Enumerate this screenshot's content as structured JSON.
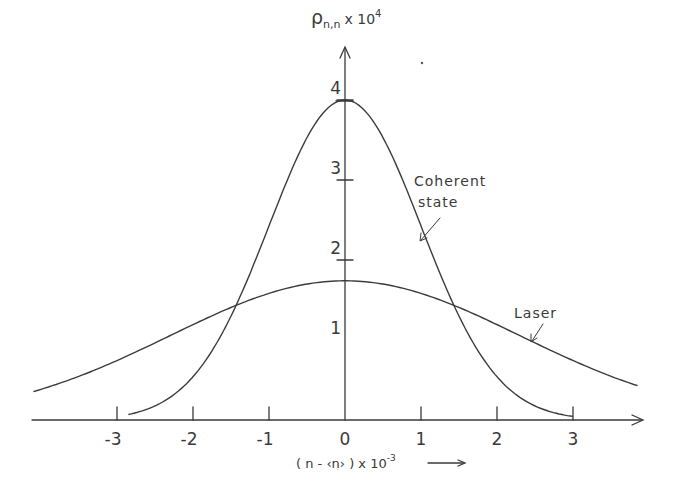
{
  "chart_data": {
    "type": "line",
    "title": "",
    "xlabel": "(n-<n>) x 10^-3",
    "ylabel": "ρ_{n,n} x 10^4",
    "xlim": [
      -4.1,
      3.9
    ],
    "ylim": [
      0,
      4.4
    ],
    "grid": false,
    "legend": "none (curves annotated directly)",
    "x_ticks": [
      -3,
      -2,
      -1,
      0,
      1,
      2,
      3
    ],
    "x_tick_labels": [
      "-3",
      "-2",
      "-1",
      "0",
      "1",
      "2",
      "3"
    ],
    "y_ticks": [
      1,
      2,
      3,
      4
    ],
    "y_tick_labels": [
      "1",
      "2",
      "3",
      "4"
    ],
    "series": [
      {
        "name": "Coherent state",
        "shape": "gaussian",
        "peak": 4.0,
        "center": 0,
        "sigma": 1.0,
        "x_range": [
          -2.85,
          3.0
        ],
        "x": [
          -2.85,
          -2,
          -1.5,
          -1,
          -0.5,
          0,
          0.5,
          1,
          1.5,
          2,
          3
        ],
        "values": [
          0.07,
          0.54,
          1.3,
          2.43,
          3.53,
          4.0,
          3.53,
          2.43,
          1.3,
          0.54,
          0.04
        ]
      },
      {
        "name": "Laser",
        "shape": "gaussian",
        "peak": 1.74,
        "center": 0,
        "sigma": 2.3,
        "x_range": [
          -4.1,
          3.85
        ],
        "x": [
          -4,
          -3,
          -2,
          -1,
          0,
          1,
          2,
          3,
          3.85
        ],
        "values": [
          0.38,
          0.74,
          1.19,
          1.58,
          1.74,
          1.58,
          1.19,
          0.74,
          0.43
        ]
      }
    ],
    "annotations": [
      {
        "text": "Coherent",
        "line2": "state",
        "points_to": "Coherent state",
        "at": [
          1.1,
          2.2
        ]
      },
      {
        "text": "Laser",
        "points_to": "Laser",
        "at": [
          2.5,
          0.9
        ]
      }
    ]
  },
  "labels": {
    "y_axis_symbol": "ρ",
    "y_axis_subscript": "n,n",
    "y_axis_factor": "x 10",
    "y_axis_exp": "4",
    "x_axis_text": "( n - ‹n› ) x 10",
    "x_axis_exp": "-3",
    "coherent_line1": "Coherent",
    "coherent_line2": "state",
    "laser": "Laser"
  }
}
